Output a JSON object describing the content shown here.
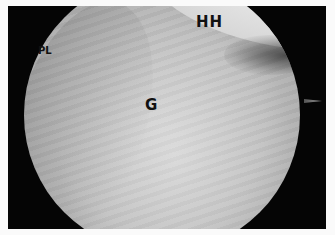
{
  "image": {
    "type": "arthroscopic view",
    "colors": {
      "border": "#fafafa",
      "background": "#050505",
      "tissue": "#c0c0c0",
      "label": "#111111"
    }
  },
  "labels": {
    "pl": "PL",
    "hh": "HH",
    "g": "G"
  }
}
